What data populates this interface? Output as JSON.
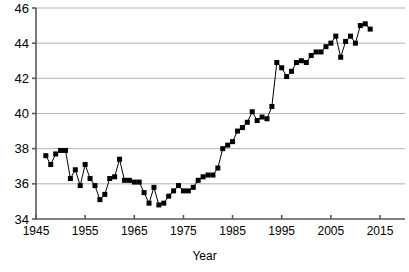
{
  "chart_data": {
    "type": "line",
    "title": "",
    "subtitle": "",
    "xlabel": "Year",
    "ylabel": "",
    "xlim": [
      1945,
      2015
    ],
    "ylim": [
      34,
      46
    ],
    "xticks": [
      1945,
      1955,
      1965,
      1975,
      1985,
      1995,
      2005,
      2015
    ],
    "yticks": [
      34,
      36,
      38,
      40,
      42,
      44,
      46
    ],
    "xtick_labels": [
      "1945",
      "1955",
      "1965",
      "1975",
      "1985",
      "1995",
      "2005",
      "2015"
    ],
    "ytick_labels": [
      "34",
      "36",
      "38",
      "40",
      "42",
      "44",
      "46"
    ],
    "grid": "horizontal",
    "legend": "none",
    "marker": "square",
    "line_color": "#000000",
    "marker_color": "#000000",
    "grid_color": "#b4b4b4",
    "axis_color": "#595959",
    "background": "#ffffff",
    "x": [
      1947,
      1948,
      1949,
      1950,
      1951,
      1952,
      1953,
      1954,
      1955,
      1956,
      1957,
      1958,
      1959,
      1960,
      1961,
      1962,
      1963,
      1964,
      1965,
      1966,
      1967,
      1968,
      1969,
      1970,
      1971,
      1972,
      1973,
      1974,
      1975,
      1976,
      1977,
      1978,
      1979,
      1980,
      1981,
      1982,
      1983,
      1984,
      1985,
      1986,
      1987,
      1988,
      1989,
      1990,
      1991,
      1992,
      1993,
      1994,
      1995,
      1996,
      1997,
      1998,
      1999,
      2000,
      2001,
      2002,
      2003,
      2004,
      2005,
      2006,
      2007,
      2008,
      2009,
      2010,
      2011,
      2012,
      2013
    ],
    "y": [
      37.6,
      37.1,
      37.7,
      37.9,
      37.9,
      36.3,
      36.8,
      35.9,
      37.1,
      36.3,
      35.9,
      35.1,
      35.4,
      36.3,
      36.4,
      37.4,
      36.2,
      36.2,
      36.1,
      36.1,
      35.5,
      34.9,
      35.8,
      34.8,
      34.9,
      35.3,
      35.6,
      35.9,
      35.6,
      35.6,
      35.8,
      36.2,
      36.4,
      36.5,
      36.5,
      36.9,
      38.0,
      38.2,
      38.4,
      39.0,
      39.2,
      39.5,
      40.1,
      39.6,
      39.8,
      39.7,
      40.4,
      42.9,
      42.6,
      42.1,
      42.4,
      42.9,
      43.0,
      42.9,
      43.3,
      43.5,
      43.5,
      43.8,
      44.0,
      44.4,
      43.2,
      44.1,
      44.4,
      44.0,
      45.0,
      45.1,
      44.8
    ],
    "series_name": ""
  }
}
